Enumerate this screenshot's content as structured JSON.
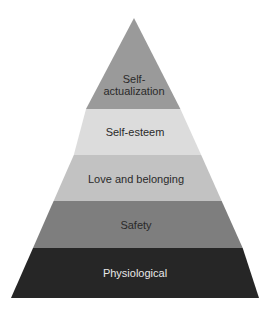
{
  "diagram": {
    "type": "pyramid",
    "layers": [
      {
        "label_line1": "Self-",
        "label_line2": "actualization",
        "color": "#9a9a9a",
        "text_color": "#2a2a2a"
      },
      {
        "label": "Self-esteem",
        "color": "#dcdcdc",
        "text_color": "#3a3a3a"
      },
      {
        "label": "Love and belonging",
        "color": "#c2c2c2",
        "text_color": "#2a2a2a"
      },
      {
        "label": "Safety",
        "color": "#7e7e7e",
        "text_color": "#2a2a2a"
      },
      {
        "label": "Physiological",
        "color": "#262626",
        "text_color": "#e8e8e8"
      }
    ]
  }
}
